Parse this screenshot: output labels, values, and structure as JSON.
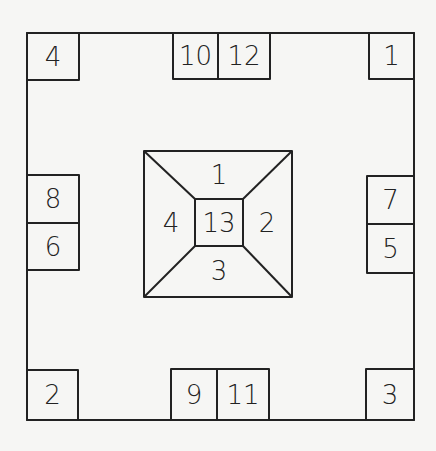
{
  "diagram": {
    "outer_corner_boxes": {
      "top_left": "4",
      "top_right": "1",
      "bottom_left": "2",
      "bottom_right": "3"
    },
    "edge_boxes": {
      "top": [
        "10",
        "12"
      ],
      "bottom": [
        "9",
        "11"
      ],
      "left": [
        "8",
        "6"
      ],
      "right": [
        "7",
        "5"
      ]
    },
    "center_pyramid": {
      "top": "1",
      "right": "2",
      "bottom": "3",
      "left": "4",
      "center": "13"
    },
    "colors": {
      "line": "#222222",
      "background": "#f6f6f4"
    }
  }
}
